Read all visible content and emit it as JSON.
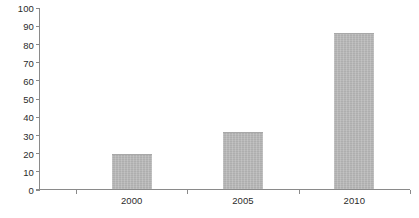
{
  "chart_data": {
    "type": "bar",
    "title": "",
    "subtitle": "",
    "xlabel": "",
    "ylabel": "",
    "categories": [
      "2000",
      "2005",
      "2010"
    ],
    "values": [
      20,
      32,
      86
    ],
    "series": [
      {
        "name": "",
        "values": [
          20,
          32,
          86
        ]
      }
    ],
    "ylim": [
      0,
      100
    ],
    "y_ticks": [
      0,
      10,
      20,
      30,
      40,
      50,
      60,
      70,
      80,
      90,
      100
    ],
    "y_tick_labels": [
      "0",
      "10",
      "20",
      "30",
      "40",
      "50",
      "60",
      "70",
      "80",
      "90",
      "100"
    ],
    "grid": false,
    "legend": false,
    "legend_position": "none",
    "annotations": [],
    "colors": {
      "bar_fill": "#b4b4b4",
      "bar_border": "#a8a8a8",
      "axis_line": "#8a8a8a",
      "tick_label": "#2b2b2b",
      "background": "#ffffff"
    }
  }
}
